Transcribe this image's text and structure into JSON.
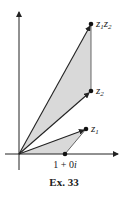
{
  "figure": {
    "caption": "Ex. 33",
    "points": {
      "unit": {
        "label": "1 + 0i",
        "label_parts": [
          "1 + 0",
          "i"
        ]
      },
      "z1": {
        "label_main": "z",
        "label_sub": "1"
      },
      "z2": {
        "label_main": "z",
        "label_sub": "2"
      },
      "z1z2": {
        "label_main1": "z",
        "label_sub1": "1",
        "label_main2": "z",
        "label_sub2": "2"
      }
    },
    "colors": {
      "line": "#222222",
      "fill": "#d9d9d9",
      "background": "#ffffff"
    }
  }
}
